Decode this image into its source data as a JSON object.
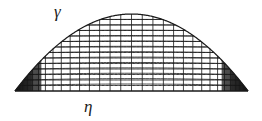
{
  "figure": {
    "background_color": "#ffffff",
    "ink_color": "#1a1a1a",
    "width": 262,
    "height": 121
  },
  "labels": {
    "curve_label": "γ",
    "baseline_label": "η"
  },
  "chart_data": {
    "type": "line",
    "title": "",
    "xlabel": "η",
    "ylabel": "γ",
    "grid": true,
    "legend_position": "none",
    "baseline": {
      "name": "η",
      "x_start": 15,
      "x_end": 248,
      "y": 91
    },
    "boundary_curve": {
      "name": "γ",
      "shape": "parabola",
      "apex_x": 131.5,
      "apex_y": 14,
      "left_foot_x": 15,
      "right_foot_x": 248,
      "foot_y": 91
    },
    "mesh": {
      "vertical_lines": 34,
      "horizontal_lines": 13,
      "vertical_spacing": "cosine-clustered toward both ends",
      "horizontal_spacing": "uniform in scaled curve fraction",
      "corner_wedges": [
        "left",
        "right"
      ]
    },
    "series": [
      {
        "name": "γ",
        "x": [
          15,
          27,
          39,
          51,
          62,
          74,
          86,
          98,
          109,
          121,
          131.5,
          142,
          154,
          166,
          177,
          189,
          201,
          213,
          224,
          236,
          248
        ],
        "y": [
          91,
          79.2,
          68.5,
          58.9,
          50.9,
          43.3,
          36.7,
          31.1,
          26.9,
          23.2,
          14,
          22.8,
          26.5,
          30.7,
          34.7,
          41.1,
          48.4,
          56.7,
          64.9,
          75.4,
          91
        ]
      }
    ]
  }
}
